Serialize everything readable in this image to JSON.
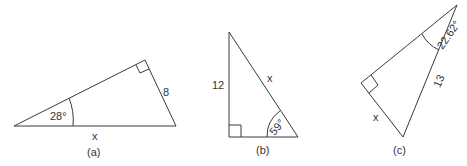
{
  "figures": [
    {
      "caption": "(a)",
      "angle_label": "28°",
      "side_right": "8",
      "side_bottom": "x",
      "right_angle": true
    },
    {
      "caption": "(b)",
      "angle_label": "59°",
      "side_left": "12",
      "side_hypotenuse": "x",
      "right_angle": true
    },
    {
      "caption": "(c)",
      "angle_label": "22.62°",
      "side_hypotenuse": "13",
      "side_short": "x",
      "right_angle": true
    }
  ],
  "colors": {
    "line": "#3a3a3a",
    "text": "#333333",
    "background": "#ffffff"
  }
}
